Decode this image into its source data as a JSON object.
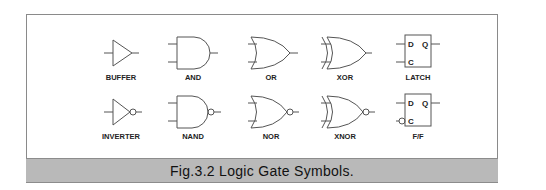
{
  "figure": {
    "caption": "Fig.3.2 Logic Gate Symbols.",
    "colors": {
      "caption_band": "#b9b9b9",
      "stroke": "#555555",
      "frame": "#8a8a8a"
    }
  },
  "gates": {
    "row1": [
      {
        "label": "BUFFER"
      },
      {
        "label": "AND"
      },
      {
        "label": "OR"
      },
      {
        "label": "XOR"
      },
      {
        "label": "LATCH",
        "pins": {
          "d": "D",
          "q": "Q",
          "c": "C"
        }
      }
    ],
    "row2": [
      {
        "label": "INVERTER"
      },
      {
        "label": "NAND"
      },
      {
        "label": "NOR"
      },
      {
        "label": "XNOR"
      },
      {
        "label": "F/F",
        "pins": {
          "d": "D",
          "q": "Q",
          "c": "C"
        }
      }
    ]
  }
}
